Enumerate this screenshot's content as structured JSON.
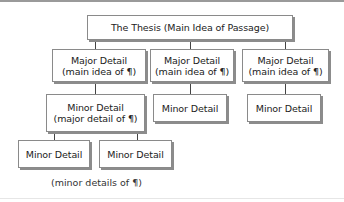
{
  "diagram": {
    "type": "hierarchy",
    "thesis": {
      "label": "The Thesis (Main Idea of Passage)"
    },
    "major_details": [
      {
        "title": "Major Detail",
        "subtitle": "(main idea of ¶)"
      },
      {
        "title": "Major Detail",
        "subtitle": "(main idea of ¶)"
      },
      {
        "title": "Major Detail",
        "subtitle": "(main idea of ¶)"
      }
    ],
    "minor_level1": [
      {
        "title": "Minor Detail",
        "subtitle": "(major detail of ¶)"
      },
      {
        "title": "Minor Detail"
      },
      {
        "title": "Minor Detail"
      }
    ],
    "minor_level2": [
      {
        "title": "Minor Detail"
      },
      {
        "title": "Minor Detail"
      }
    ],
    "caption": "(minor details of ¶)"
  }
}
